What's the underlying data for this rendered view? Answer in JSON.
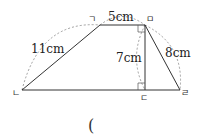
{
  "diagram": {
    "shape": "trapezoid",
    "vertices": {
      "top_left": "ㄱ",
      "top_right": "ㅁ",
      "bottom_left": "ㄴ",
      "foot": "ㄷ",
      "bottom_right": "ㄹ"
    },
    "lengths": {
      "left_side": "11cm",
      "top_side": "5cm",
      "height": "7cm",
      "right_side": "8cm"
    },
    "answer_blank": "("
  }
}
